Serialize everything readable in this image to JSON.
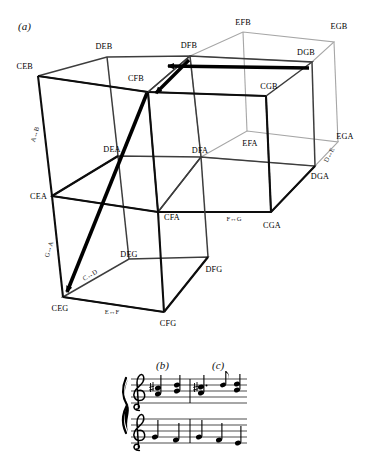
{
  "figure": {
    "panels": {
      "a": "(a)",
      "b": "(b)",
      "c": "(c)"
    },
    "colors": {
      "ink": "#000000",
      "bold_edge": "#111111",
      "mid_edge": "#4a4a4a",
      "faint_edge": "#9a9a9a",
      "arrow": "#000000",
      "background": "#ffffff"
    }
  },
  "diagram": {
    "type": "cube-lattice",
    "vertices": [
      {
        "id": "CEB",
        "label": "CEB",
        "x": 38,
        "y": 76,
        "anchor": "end",
        "lx": 33,
        "ly": 69
      },
      {
        "id": "DEB",
        "label": "DEB",
        "x": 107,
        "y": 57,
        "anchor": "middle",
        "lx": 104,
        "ly": 49
      },
      {
        "id": "CFB",
        "label": "CFB",
        "x": 148,
        "y": 92,
        "anchor": "end",
        "lx": 144,
        "ly": 80
      },
      {
        "id": "DFB",
        "label": "DFB",
        "x": 190,
        "y": 56,
        "anchor": "middle",
        "lx": 189,
        "ly": 49
      },
      {
        "id": "EFB",
        "label": "EFB",
        "x": 243,
        "y": 32,
        "anchor": "middle",
        "lx": 243,
        "ly": 27
      },
      {
        "id": "EGB",
        "label": "EGB",
        "x": 334,
        "y": 42,
        "anchor": "middle",
        "lx": 340,
        "ly": 30
      },
      {
        "id": "DGB",
        "label": "DGB",
        "x": 312,
        "y": 62,
        "anchor": "middle",
        "lx": 305,
        "ly": 55
      },
      {
        "id": "CGB",
        "label": "CGB",
        "x": 266,
        "y": 96,
        "anchor": "middle",
        "lx": 268,
        "ly": 88
      },
      {
        "id": "CEA",
        "label": "CEA",
        "x": 52,
        "y": 196,
        "anchor": "end",
        "lx": 47,
        "ly": 199
      },
      {
        "id": "DEA",
        "label": "DEA",
        "x": 118,
        "y": 156,
        "anchor": "middle",
        "lx": 113,
        "ly": 151
      },
      {
        "id": "CFA",
        "label": "CFA",
        "x": 158,
        "y": 212,
        "anchor": "middle",
        "lx": 170,
        "ly": 219
      },
      {
        "id": "DFA",
        "label": "DFA",
        "x": 201,
        "y": 157,
        "anchor": "middle",
        "lx": 200,
        "ly": 152
      },
      {
        "id": "EFA",
        "label": "EFA",
        "x": 247,
        "y": 131,
        "anchor": "middle",
        "lx": 249,
        "ly": 146
      },
      {
        "id": "EGA",
        "label": "EGA",
        "x": 338,
        "y": 142,
        "anchor": "middle",
        "lx": 345,
        "ly": 138
      },
      {
        "id": "DGA",
        "label": "DGA",
        "x": 315,
        "y": 166,
        "anchor": "middle",
        "lx": 320,
        "ly": 178
      },
      {
        "id": "CGA",
        "label": "CGA",
        "x": 271,
        "y": 212,
        "anchor": "middle",
        "lx": 272,
        "ly": 228
      },
      {
        "id": "CEG",
        "label": "CEG",
        "x": 63,
        "y": 297,
        "anchor": "middle",
        "lx": 60,
        "ly": 311
      },
      {
        "id": "DEG",
        "label": "DEG",
        "x": 129,
        "y": 259,
        "anchor": "middle",
        "lx": 127,
        "ly": 256
      },
      {
        "id": "CFG",
        "label": "CFG",
        "x": 164,
        "y": 312,
        "anchor": "middle",
        "lx": 167,
        "ly": 325
      },
      {
        "id": "DFG",
        "label": "DFG",
        "x": 208,
        "y": 257,
        "anchor": "middle",
        "lx": 213,
        "ly": 271
      }
    ],
    "edge_labels": [
      {
        "id": "A-B",
        "text": "A↔B",
        "x": 37,
        "y": 135,
        "rotate": -74
      },
      {
        "id": "G-A",
        "text": "G↔A",
        "x": 51,
        "y": 250,
        "rotate": -74
      },
      {
        "id": "C-D",
        "text": "C↔D",
        "x": 91,
        "y": 276,
        "rotate": -31
      },
      {
        "id": "E-F",
        "text": "E↔F",
        "x": 112,
        "y": 313,
        "rotate": 0
      },
      {
        "id": "F-G",
        "text": "F↔G",
        "x": 233,
        "y": 220,
        "rotate": 0
      },
      {
        "id": "D-E",
        "text": "D↔E",
        "x": 330,
        "y": 156,
        "rotate": -62
      }
    ],
    "arrows": [
      {
        "id": "arrow-dgb-to-dfb",
        "from": "DGB",
        "to": "DFB",
        "label": ""
      },
      {
        "id": "arrow-dfb-to-cfb",
        "from": "DFB",
        "to": "CFB",
        "label": ""
      },
      {
        "id": "arrow-cfb-to-ceg",
        "from": "CFB",
        "to": "CEG",
        "label": ""
      }
    ]
  },
  "score": {
    "systems": [
      {
        "id": "upper-staff",
        "clef": "treble",
        "measures": [
          {
            "id": "measure-b",
            "panel": "(b)",
            "chords": [
              {
                "notes": [
                  "B4",
                  "E5"
                ],
                "stem": "up"
              },
              {
                "notes": [
                  "A4",
                  "F5"
                ],
                "stem": "up"
              }
            ]
          },
          {
            "id": "measure-c",
            "panel": "(c)",
            "chords": [
              {
                "notes": [
                  "B4",
                  "E5"
                ],
                "dotted": true,
                "stem": "up"
              },
              {
                "notes": [
                  "G5"
                ],
                "stem": "up",
                "flag": true
              },
              {
                "notes": [
                  "A4",
                  "F5"
                ],
                "stem": "up"
              }
            ]
          }
        ]
      },
      {
        "id": "lower-staff",
        "clef": "treble",
        "measures": [
          {
            "id": "measure-b-bass",
            "chords": [
              {
                "notes": [
                  "D4"
                ],
                "stem": "up"
              },
              {
                "notes": [
                  "C4"
                ],
                "stem": "up"
              }
            ]
          },
          {
            "id": "measure-c-bass",
            "chords": [
              {
                "notes": [
                  "D4"
                ],
                "stem": "up"
              },
              {
                "notes": [
                  "C4"
                ],
                "stem": "up"
              },
              {
                "notes": [
                  "B3"
                ],
                "stem": "up"
              }
            ]
          }
        ]
      }
    ]
  }
}
